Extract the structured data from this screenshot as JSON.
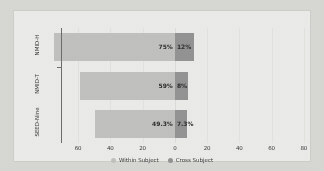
{
  "chart_data": {
    "type": "bar",
    "orientation": "horizontal",
    "layout": "diverging",
    "title": "",
    "subtitle": "",
    "xlabel": "",
    "ylabel": "",
    "categories": [
      "NMID-H",
      "NMID-T",
      "SEED-Nine"
    ],
    "series": [
      {
        "name": "Within Subject",
        "direction": "left",
        "color": "#c2c2c0",
        "values": [
          75,
          59,
          49.3
        ],
        "labels": [
          "75%",
          "59%",
          "49.3%"
        ]
      },
      {
        "name": "Cross Subject",
        "direction": "right",
        "color": "#949494",
        "values": [
          12,
          8,
          7.3
        ],
        "labels": [
          "12%",
          "8%",
          "7.3%"
        ]
      }
    ],
    "xticks": [
      {
        "label": "60",
        "value": -60
      },
      {
        "label": "40",
        "value": -40
      },
      {
        "label": "20",
        "value": -20
      },
      {
        "label": "0",
        "value": 0
      },
      {
        "label": "20",
        "value": 20
      },
      {
        "label": "40",
        "value": 40
      },
      {
        "label": "60",
        "value": 60
      },
      {
        "label": "80",
        "value": 80
      }
    ],
    "xlim": [
      -70,
      90
    ],
    "grid": false,
    "legend_position": "bottom"
  },
  "legend": {
    "entries": [
      {
        "label": "Within Subject",
        "color": "#c2c2c0"
      },
      {
        "label": "Cross Subject",
        "color": "#949494"
      }
    ]
  },
  "colors": {
    "background": "#d8d8d5",
    "card": "#ececea",
    "within_subject": "#c2c2c0",
    "cross_subject": "#949494",
    "axis": "#6e6e6e",
    "text": "#3a3a3a"
  }
}
